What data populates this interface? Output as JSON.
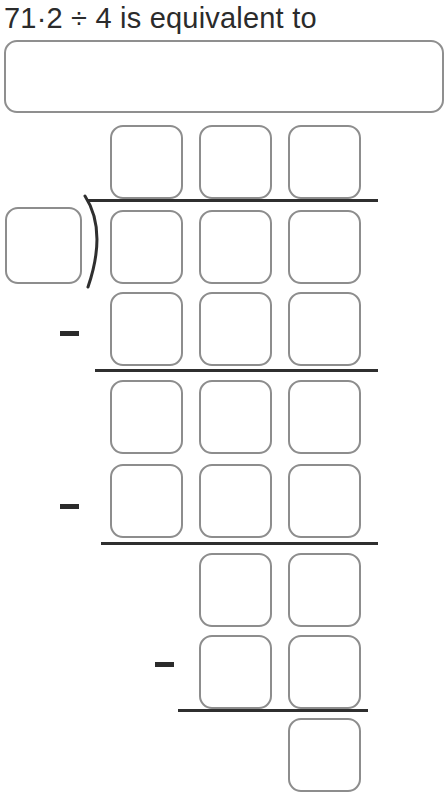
{
  "question": {
    "text": "71·2 ÷ 4 is equivalent to",
    "dividend": "71·2",
    "divisor": "4",
    "operator": "÷"
  },
  "answer_field": {
    "value": "",
    "placeholder": ""
  },
  "division_work": {
    "bracket_symbol": ")",
    "minus_symbol": "−",
    "divisor_cell": {
      "value": ""
    },
    "rows": [
      {
        "name": "quotient",
        "top": 125,
        "columns": [
          1,
          2,
          3
        ],
        "cells": [
          {
            "value": ""
          },
          {
            "value": ""
          },
          {
            "value": ""
          }
        ]
      },
      {
        "name": "dividend",
        "top": 210,
        "columns": [
          1,
          2,
          3
        ],
        "cells": [
          {
            "value": ""
          },
          {
            "value": ""
          },
          {
            "value": ""
          }
        ]
      },
      {
        "name": "subtrahend-1",
        "top": 292,
        "columns": [
          1,
          2,
          3
        ],
        "minus": true,
        "cells": [
          {
            "value": ""
          },
          {
            "value": ""
          },
          {
            "value": ""
          }
        ]
      },
      {
        "name": "remainder-1",
        "top": 380,
        "columns": [
          1,
          2,
          3
        ],
        "cells": [
          {
            "value": ""
          },
          {
            "value": ""
          },
          {
            "value": ""
          }
        ]
      },
      {
        "name": "subtrahend-2",
        "top": 464,
        "columns": [
          1,
          2,
          3
        ],
        "minus": true,
        "cells": [
          {
            "value": ""
          },
          {
            "value": ""
          },
          {
            "value": ""
          }
        ]
      },
      {
        "name": "remainder-2",
        "top": 553,
        "columns": [
          2,
          3
        ],
        "cells": [
          {
            "value": ""
          },
          {
            "value": ""
          }
        ]
      },
      {
        "name": "subtrahend-3",
        "top": 635,
        "columns": [
          2,
          3
        ],
        "minus": true,
        "cells": [
          {
            "value": ""
          },
          {
            "value": ""
          }
        ]
      },
      {
        "name": "remainder-3",
        "top": 718,
        "columns": [
          3
        ],
        "cells": [
          {
            "value": ""
          }
        ]
      }
    ],
    "rules": [
      {
        "name": "vinculum",
        "left": 88,
        "top": 199,
        "width": 290
      },
      {
        "name": "subtraction-rule-1",
        "left": 95,
        "top": 369,
        "width": 283
      },
      {
        "name": "subtraction-rule-2",
        "left": 101,
        "top": 542,
        "width": 277
      },
      {
        "name": "subtraction-rule-3",
        "left": 178,
        "top": 709,
        "width": 190
      }
    ],
    "minus_signs": [
      {
        "name": "minus-1",
        "left": 60,
        "top": 331
      },
      {
        "name": "minus-2",
        "left": 60,
        "top": 504
      },
      {
        "name": "minus-3",
        "left": 155,
        "top": 662
      }
    ]
  },
  "colors": {
    "box_border": "#8d8d8d",
    "rule": "#2f2f2f",
    "text": "#2b2b2b",
    "background": "#ffffff"
  },
  "layout": {
    "column_left": [
      110,
      199,
      288
    ],
    "box_width": 73,
    "box_height": 74
  }
}
